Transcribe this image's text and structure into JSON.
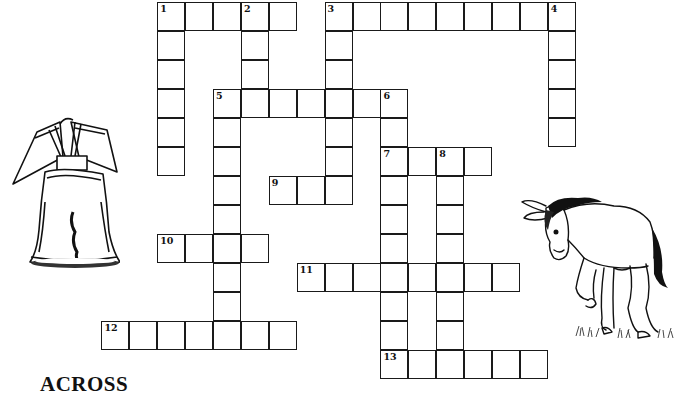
{
  "puzzle": {
    "type": "crossword",
    "cell_size": {
      "w": 27.9,
      "h": 29
    },
    "origin": {
      "x": 158,
      "y": 3
    },
    "entries": [
      {
        "number": "1",
        "dir": "across",
        "row": 0,
        "col": 0,
        "length": 5
      },
      {
        "number": "1",
        "dir": "down",
        "row": 0,
        "col": 0,
        "length": 6
      },
      {
        "number": "2",
        "dir": "down",
        "row": 0,
        "col": 3,
        "length": 4
      },
      {
        "number": "3",
        "dir": "across",
        "row": 0,
        "col": 6,
        "length": 9
      },
      {
        "number": "3",
        "dir": "down",
        "row": 0,
        "col": 6,
        "length": 7
      },
      {
        "number": "4",
        "dir": "down",
        "row": 0,
        "col": 14,
        "length": 5
      },
      {
        "number": "5",
        "dir": "across",
        "row": 3,
        "col": 2,
        "length": 7
      },
      {
        "number": "5",
        "dir": "down",
        "row": 3,
        "col": 2,
        "length": 9
      },
      {
        "number": "6",
        "dir": "down",
        "row": 3,
        "col": 8,
        "length": 10
      },
      {
        "number": "7",
        "dir": "across",
        "row": 5,
        "col": 8,
        "length": 4
      },
      {
        "number": "8",
        "dir": "down",
        "row": 5,
        "col": 10,
        "length": 8
      },
      {
        "number": "9",
        "dir": "across",
        "row": 6,
        "col": 4,
        "length": 3
      },
      {
        "number": "10",
        "dir": "across",
        "row": 8,
        "col": 0,
        "length": 4
      },
      {
        "number": "11",
        "dir": "across",
        "row": 9,
        "col": 5,
        "length": 8
      },
      {
        "number": "12",
        "dir": "across",
        "row": 11,
        "col": -2,
        "length": 7
      },
      {
        "number": "13",
        "dir": "across",
        "row": 12,
        "col": 8,
        "length": 6
      }
    ]
  },
  "clues": {
    "across_heading": "ACROSS"
  },
  "illustrations": [
    {
      "name": "liberty-bell",
      "desc": "Liberty Bell with crack"
    },
    {
      "name": "donkey",
      "desc": "Donkey standing on grass"
    }
  ]
}
